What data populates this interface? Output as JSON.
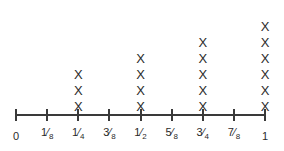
{
  "chart_data": {
    "type": "bar",
    "title": "",
    "subtitle": "",
    "xlabel": "",
    "ylabel": "",
    "grid": false,
    "legend": null,
    "notation": "Each X represents one data point stacked above its value on the number line.",
    "mark_glyph": "X",
    "axis_range": [
      0,
      1
    ],
    "categories": [
      "0",
      "1/8",
      "1/4",
      "3/8",
      "1/2",
      "5/8",
      "3/4",
      "7/8",
      "1"
    ],
    "x": [
      0,
      0.125,
      0.25,
      0.375,
      0.5,
      0.625,
      0.75,
      0.875,
      1
    ],
    "values": [
      0,
      0,
      3,
      0,
      4,
      0,
      5,
      0,
      6
    ],
    "ylim": [
      0,
      6
    ],
    "tick_labels": [
      {
        "label": "0",
        "numerator": "0",
        "denominator": "",
        "whole": true
      },
      {
        "label": "1/8",
        "numerator": "1",
        "denominator": "8",
        "whole": false
      },
      {
        "label": "1/4",
        "numerator": "1",
        "denominator": "4",
        "whole": false
      },
      {
        "label": "3/8",
        "numerator": "3",
        "denominator": "8",
        "whole": false
      },
      {
        "label": "1/2",
        "numerator": "1",
        "denominator": "2",
        "whole": false
      },
      {
        "label": "5/8",
        "numerator": "5",
        "denominator": "8",
        "whole": false
      },
      {
        "label": "3/4",
        "numerator": "3",
        "denominator": "4",
        "whole": false
      },
      {
        "label": "7/8",
        "numerator": "7",
        "denominator": "8",
        "whole": false
      },
      {
        "label": "1",
        "numerator": "1",
        "denominator": "",
        "whole": true
      }
    ]
  },
  "colors": {
    "background": "#ffffff",
    "axis": "#3a3a3a",
    "mark": "#2b2b2b",
    "label": "#2b2b2b"
  }
}
